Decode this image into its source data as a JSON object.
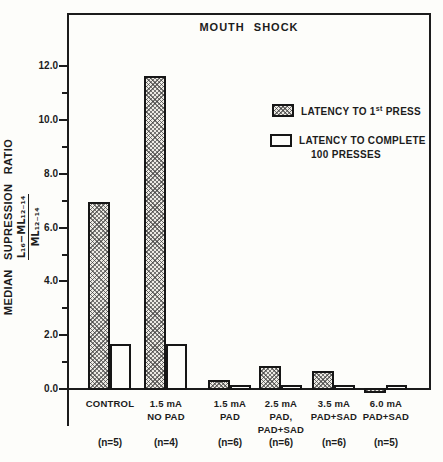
{
  "figure": {
    "title": "MOUTH SHOCK",
    "y_axis_label": "MEDIAN SUPRESSION RATIO",
    "y_axis_fraction": {
      "numerator": "L₁₆−ML₁₂₋₁₄",
      "denominator": "ML₁₂₋₁₄"
    },
    "legend": {
      "first_press": {
        "pre": "LATENCY TO 1",
        "sup": "st",
        "post": " PRESS"
      },
      "complete_line1": "LATENCY TO COMPLETE",
      "complete_line2": "100 PRESSES"
    },
    "colors": {
      "ink": "#1c1c1c",
      "paper": "#fdfdfa"
    }
  },
  "chart_data": {
    "type": "bar",
    "title": "MOUTH SHOCK",
    "ylabel": "MEDIAN SUPRESSION RATIO (L₁₆−ML₁₂₋₁₄)/ML₁₂₋₁₄",
    "ylim": [
      0,
      14
    ],
    "yticks_labeled": [
      0.0,
      2.0,
      4.0,
      6.0,
      8.0,
      10.0,
      12.0
    ],
    "yticks_minor": [
      1.0,
      3.0,
      5.0,
      7.0,
      9.0,
      11.0
    ],
    "grid": false,
    "legend_position": "upper right",
    "categories": [
      "CONTROL",
      "1.5 mA NO PAD",
      "1.5 mA PAD",
      "2.5 mA PAD, PAD+SAD",
      "3.5 mA PAD+SAD",
      "6.0 mA PAD+SAD"
    ],
    "category_label_lines": [
      [
        "CONTROL"
      ],
      [
        "1.5 mA",
        "NO PAD"
      ],
      [
        "1.5 mA",
        "PAD"
      ],
      [
        "2.5 mA",
        "PAD,",
        "PAD+SAD"
      ],
      [
        "3.5 mA",
        "PAD+SAD"
      ],
      [
        "6.0 mA",
        "PAD+SAD"
      ]
    ],
    "n_labels": [
      "(n=5)",
      "(n=4)",
      "(n=6)",
      "(n=6)",
      "(n=6)",
      "(n=5)"
    ],
    "n_per_group": [
      5,
      4,
      6,
      6,
      6,
      5
    ],
    "series": [
      {
        "name": "LATENCY TO 1st PRESS",
        "style": "hatched",
        "values": [
          6.9,
          11.6,
          0.3,
          0.8,
          0.65,
          -0.12
        ]
      },
      {
        "name": "LATENCY TO COMPLETE 100 PRESSES",
        "style": "open",
        "values": [
          1.65,
          1.65,
          0.1,
          0.12,
          0.1,
          0.1
        ]
      }
    ]
  }
}
